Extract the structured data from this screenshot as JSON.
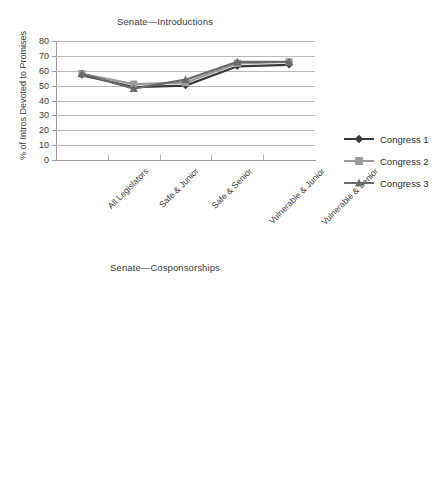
{
  "charts": [
    {
      "id": "senate-introductions",
      "title": "Senate—Introductions",
      "ylabel": "% of Intros Devoted to Promises",
      "categories": [
        "All Legislators",
        "Safe & Junior",
        "Safe & Senior",
        "Vulnerable & Junior",
        "Vulnerable & Senior"
      ],
      "yticks": [
        0,
        10,
        20,
        30,
        40,
        50,
        60,
        70,
        80
      ],
      "ylim": [
        0,
        80
      ],
      "series": [
        {
          "name": "Congress 1",
          "values": [
            57,
            49,
            50,
            63,
            64
          ],
          "color": "#3a3a3a",
          "marker": "diamond"
        },
        {
          "name": "Congress 2",
          "values": [
            58,
            51,
            52,
            65,
            66
          ],
          "color": "#9b9b9b",
          "marker": "square"
        },
        {
          "name": "Congress 3",
          "values": [
            58,
            48,
            54,
            66,
            66
          ],
          "color": "#6a6a6a",
          "marker": "triangle"
        }
      ]
    },
    {
      "id": "senate-cosponsorships",
      "title": "Senate—Cosponsorships",
      "ylabel": "% of Cosp Devoted to Promises",
      "categories": [
        "All Legislators",
        "Safe & Junior",
        "Safe & Senior",
        "Vulnerable & Junior",
        "Vulnerable & Senior"
      ],
      "yticks": [
        0,
        10,
        20,
        30,
        40,
        50,
        60,
        70
      ],
      "ylim": [
        0,
        70
      ],
      "series": [
        {
          "name": "Congress 1",
          "values": [
            52,
            50,
            49,
            55,
            58
          ],
          "color": "#3a3a3a",
          "marker": "diamond"
        },
        {
          "name": "Congress 2",
          "values": [
            53,
            49,
            50,
            58,
            59
          ],
          "color": "#9b9b9b",
          "marker": "square"
        },
        {
          "name": "Congress 3",
          "values": [
            53,
            50,
            49,
            58,
            56
          ],
          "color": "#6a6a6a",
          "marker": "triangle"
        }
      ]
    }
  ],
  "chart_data": [
    {
      "type": "line",
      "title": "Senate—Introductions",
      "xlabel": "",
      "ylabel": "% of Intros Devoted to Promises",
      "categories": [
        "All Legislators",
        "Safe & Junior",
        "Safe & Senior",
        "Vulnerable & Junior",
        "Vulnerable & Senior"
      ],
      "ylim": [
        0,
        80
      ],
      "yticks": [
        0,
        10,
        20,
        30,
        40,
        50,
        60,
        70,
        80
      ],
      "grid": "horizontal",
      "legend_position": "right",
      "series": [
        {
          "name": "Congress 1",
          "values": [
            57,
            49,
            50,
            63,
            64
          ]
        },
        {
          "name": "Congress 2",
          "values": [
            58,
            51,
            52,
            65,
            66
          ]
        },
        {
          "name": "Congress 3",
          "values": [
            58,
            48,
            54,
            66,
            66
          ]
        }
      ]
    },
    {
      "type": "line",
      "title": "Senate—Cosponsorships",
      "xlabel": "",
      "ylabel": "% of Cosp Devoted to Promises",
      "categories": [
        "All Legislators",
        "Safe & Junior",
        "Safe & Senior",
        "Vulnerable & Junior",
        "Vulnerable & Senior"
      ],
      "ylim": [
        0,
        70
      ],
      "yticks": [
        0,
        10,
        20,
        30,
        40,
        50,
        60,
        70
      ],
      "grid": "horizontal",
      "legend_position": "right",
      "series": [
        {
          "name": "Congress 1",
          "values": [
            52,
            50,
            49,
            55,
            58
          ]
        },
        {
          "name": "Congress 2",
          "values": [
            53,
            49,
            50,
            58,
            59
          ]
        },
        {
          "name": "Congress 3",
          "values": [
            53,
            50,
            49,
            58,
            56
          ]
        }
      ]
    }
  ]
}
